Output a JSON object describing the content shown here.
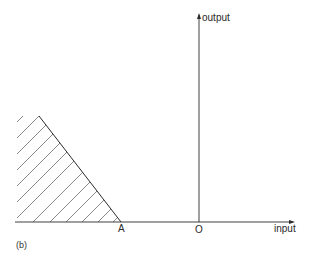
{
  "figure": {
    "panel_label": "(b)",
    "y_axis_label": "output",
    "x_axis_label": "input",
    "origin_label": "O",
    "point_a_label": "A"
  },
  "colors": {
    "line": "#2a2a2a",
    "hatch": "#6b6b6b",
    "background": "#ffffff"
  },
  "geometry": {
    "x_axis": {
      "x1": 15,
      "x2": 293,
      "y": 222
    },
    "y_axis": {
      "x": 199,
      "y1": 222,
      "y2": 14
    },
    "boundary_line": {
      "x1": 39,
      "y1": 116,
      "x2": 121,
      "y2": 222
    },
    "hatch_region": "left of boundary line A, above input axis, shaded with 45° diagonal lines"
  }
}
